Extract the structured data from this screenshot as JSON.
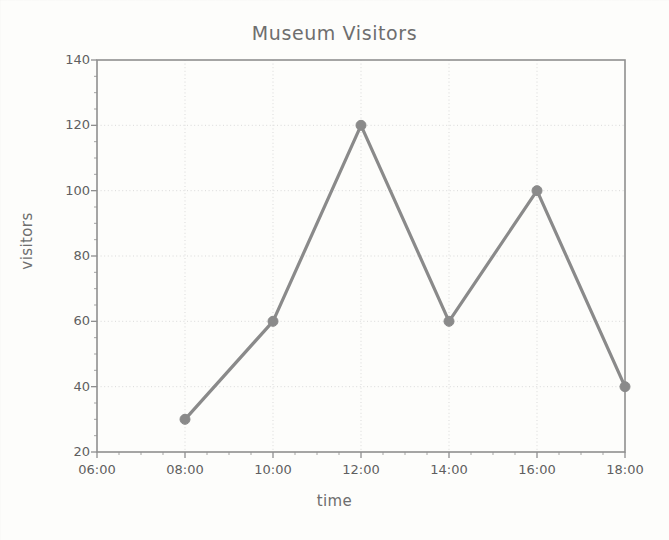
{
  "chart_data": {
    "type": "line",
    "title": "Museum Visitors",
    "xlabel": "time",
    "ylabel": "visitors",
    "x": [
      "06:00",
      "08:00",
      "10:00",
      "12:00",
      "14:00",
      "16:00",
      "18:00"
    ],
    "categories": [
      "08:00",
      "10:00",
      "12:00",
      "14:00",
      "16:00",
      "18:00"
    ],
    "values": [
      30,
      60,
      120,
      60,
      100,
      40
    ],
    "series": [
      {
        "name": "visitors",
        "points": [
          {
            "x": "08:00",
            "y": 30
          },
          {
            "x": "10:00",
            "y": 60
          },
          {
            "x": "12:00",
            "y": 120
          },
          {
            "x": "14:00",
            "y": 60
          },
          {
            "x": "16:00",
            "y": 100
          },
          {
            "x": "18:00",
            "y": 40
          }
        ]
      }
    ],
    "xtick_labels": [
      "06:00",
      "08:00",
      "10:00",
      "12:00",
      "14:00",
      "16:00",
      "18:00"
    ],
    "ytick_labels": [
      "20",
      "40",
      "60",
      "80",
      "100",
      "120",
      "140"
    ],
    "ylim": [
      20,
      140
    ],
    "xlim": [
      "06:00",
      "18:00"
    ],
    "ytick_step": 20,
    "yminor_step": 5,
    "xtick_step_hours": 2,
    "xminor_per_major": 4,
    "grid": true,
    "legend": false,
    "marker": "circle",
    "line_color": "#8a8a8a",
    "marker_color": "#8a8a8a",
    "grid_color": "#d8d8d8",
    "axis_color": "#8f8f8f",
    "text_color": "#6e6e6e",
    "background_color": "#fdfdfc"
  },
  "plot_box": {
    "left": 97,
    "right": 625,
    "top": 60,
    "bottom": 452
  }
}
